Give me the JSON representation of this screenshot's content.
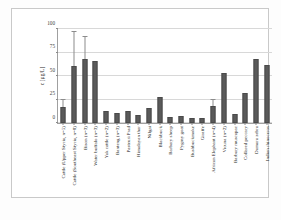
{
  "chart_data": {
    "type": "bar",
    "title": "",
    "xlabel": "",
    "ylabel": "c [µg/L]",
    "ylim": [
      0,
      100
    ],
    "yticks": [
      0,
      25,
      50,
      75,
      100
    ],
    "ytick_labels": [
      "0",
      "25",
      "50",
      "75",
      "100"
    ],
    "grid": true,
    "legend": "none",
    "bar_color": "#5a5a5a",
    "errorbar_color": "#8c8c8c",
    "categories": [
      "Cattle (Upper Styria, n=5)",
      "Cattle (Southeast Styria, n=8)",
      "Bison (n=3)",
      "Water buffalo (n=3)",
      "Yak cattle (n=2)",
      "Banteng (n=3)",
      "Pasteuri Prad",
      "Himalayan thar",
      "Nilgai",
      "Blackbuck",
      "Barbary sheep",
      "Pygmy goat",
      "Bushbuckmoke",
      "Giraffe",
      "African Elephant (n=4)",
      "Vicuna (n=2)",
      "Barbary muscapac",
      "Collared peccary",
      "Damara zebra",
      "Indian rhinoceros"
    ],
    "values": [
      17,
      61,
      68,
      66,
      13,
      11,
      13,
      9,
      16,
      28,
      6,
      7,
      5,
      5,
      18,
      53,
      10,
      32,
      68,
      62
    ],
    "errors": [
      7,
      36,
      23,
      0,
      0,
      0,
      0,
      0,
      0,
      0,
      0,
      0,
      0,
      0,
      6,
      0,
      0,
      0,
      0,
      0
    ]
  }
}
